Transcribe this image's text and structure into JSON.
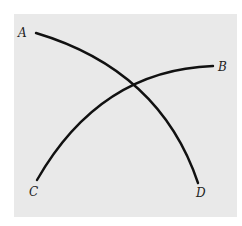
{
  "diagram": {
    "background": "#e9e9e9",
    "stroke_color": "#111111",
    "curves": [
      {
        "name": "A-D",
        "from_label": "A",
        "to_label": "D"
      },
      {
        "name": "C-B",
        "from_label": "C",
        "to_label": "B"
      }
    ],
    "labels": {
      "a": "A",
      "b": "B",
      "c": "C",
      "d": "D"
    }
  }
}
